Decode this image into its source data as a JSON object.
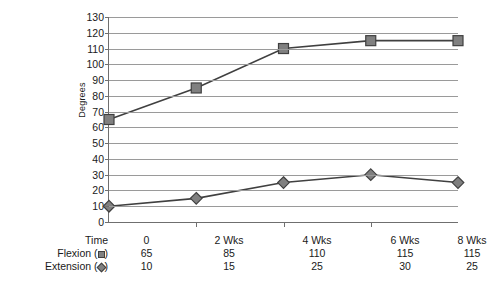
{
  "chart_data": {
    "type": "line",
    "title": "",
    "xlabel": "",
    "ylabel": "Degrees",
    "categories": [
      "0",
      "2 Wks",
      "4 Wks",
      "6 Wks",
      "8 Wks"
    ],
    "series": [
      {
        "name": "Flexion",
        "marker": "square",
        "values": [
          65,
          85,
          110,
          115,
          115
        ]
      },
      {
        "name": "Extension",
        "marker": "diamond",
        "values": [
          10,
          15,
          25,
          30,
          25
        ]
      }
    ],
    "ylim": [
      0,
      130
    ],
    "ytick_labels": [
      "0",
      "10",
      "20",
      "30",
      "40",
      "50",
      "60",
      "70",
      "80",
      "90",
      "100",
      "110",
      "120",
      "130"
    ],
    "ytick_step": 10,
    "grid": true,
    "legend_position": "table-below",
    "colors": {
      "marker_fill": "#808080",
      "marker_stroke": "#404040",
      "line": "#404040",
      "gridline": "#9a9a9a",
      "axis": "#6f6f6f",
      "text": "#1a1a1a"
    }
  },
  "table": {
    "row_labels": {
      "time": "Time",
      "flexion_prefix": "Flexion (",
      "flexion_suffix": ")",
      "extension_prefix": "Extension (",
      "extension_suffix": ")"
    },
    "time_values": [
      "0",
      "2 Wks",
      "4 Wks",
      "6 Wks",
      "8 Wks"
    ],
    "flexion_values": [
      "65",
      "85",
      "110",
      "115",
      "115"
    ],
    "extension_values": [
      "10",
      "15",
      "25",
      "30",
      "25"
    ]
  }
}
